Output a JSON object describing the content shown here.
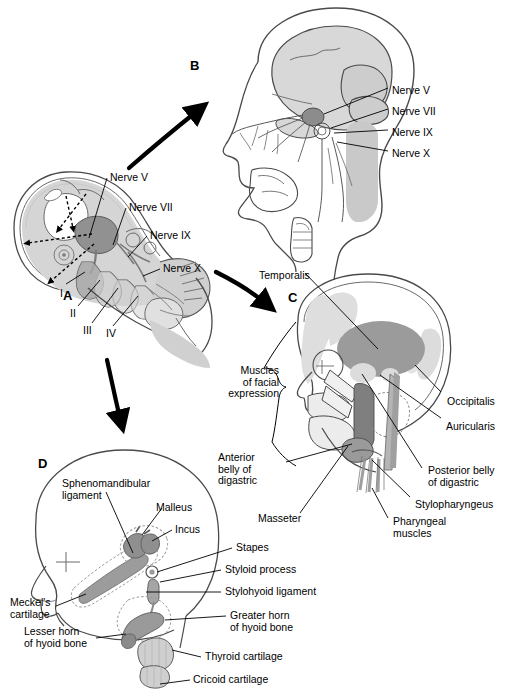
{
  "figure": {
    "panels": [
      {
        "id": "A",
        "letter": "A",
        "caption": "Embryo with pharyngeal arches and cranial nerves"
      },
      {
        "id": "B",
        "letter": "B",
        "caption": "Fetal head showing cranial nerve distribution"
      },
      {
        "id": "C",
        "letter": "C",
        "caption": "Head showing muscles derived from pharyngeal arches"
      },
      {
        "id": "D",
        "letter": "D",
        "caption": "Head showing skeletal and ligamentous derivatives"
      }
    ]
  },
  "panelA": {
    "letter": "A",
    "nerves": [
      {
        "name": "Nerve V",
        "x": 110,
        "y": 172
      },
      {
        "name": "Nerve VII",
        "x": 129,
        "y": 202
      },
      {
        "name": "Nerve IX",
        "x": 150,
        "y": 230
      },
      {
        "name": "Nerve X",
        "x": 163,
        "y": 263
      }
    ],
    "arches": [
      {
        "numeral": "I",
        "x": 60,
        "y": 288
      },
      {
        "numeral": "II",
        "x": 72,
        "y": 310
      },
      {
        "numeral": "III",
        "x": 85,
        "y": 327
      },
      {
        "numeral": "IV",
        "x": 107,
        "y": 330
      }
    ]
  },
  "panelB": {
    "letter": "B",
    "nerves": [
      {
        "name": "Nerve V",
        "x": 392,
        "y": 85
      },
      {
        "name": "Nerve VII",
        "x": 392,
        "y": 106
      },
      {
        "name": "Nerve IX",
        "x": 392,
        "y": 127
      },
      {
        "name": "Nerve X",
        "x": 392,
        "y": 148
      }
    ]
  },
  "panelC": {
    "letter": "C",
    "labels": [
      {
        "text": "Temporalis",
        "x": 259,
        "y": 270
      },
      {
        "text": "Muscles\nof facial\nexpression",
        "x": 213,
        "y": 365
      },
      {
        "text": "Anterior\nbelly of\ndigastric",
        "x": 243,
        "y": 452
      },
      {
        "text": "Masseter",
        "x": 262,
        "y": 513
      },
      {
        "text": "Occipitalis",
        "x": 447,
        "y": 396
      },
      {
        "text": "Auricularis",
        "x": 446,
        "y": 421
      },
      {
        "text": "Posterior belly\nof digastric",
        "x": 428,
        "y": 470
      },
      {
        "text": "Stylopharyngeus",
        "x": 415,
        "y": 499
      },
      {
        "text": "Pharyngeal\nmuscles",
        "x": 393,
        "y": 521
      }
    ]
  },
  "panelD": {
    "letter": "D",
    "labels": [
      {
        "text": "Sphenomandibular\nligament",
        "x": 62,
        "y": 478
      },
      {
        "text": "Malleus",
        "x": 156,
        "y": 502
      },
      {
        "text": "Incus",
        "x": 175,
        "y": 524
      },
      {
        "text": "Stapes",
        "x": 236,
        "y": 546
      },
      {
        "text": "Styloid process",
        "x": 225,
        "y": 568
      },
      {
        "text": "Stylohyoid ligament",
        "x": 225,
        "y": 590
      },
      {
        "text": "Greater horn\nof hyoid bone",
        "x": 230,
        "y": 614
      },
      {
        "text": "Thyroid cartilage",
        "x": 205,
        "y": 655
      },
      {
        "text": "Cricoid cartilage",
        "x": 193,
        "y": 678
      },
      {
        "text": "Meckel's\ncartilage",
        "x": 12,
        "y": 600
      },
      {
        "text": "Lesser horn\nof hyoid bone",
        "x": 26,
        "y": 629
      }
    ]
  },
  "arrows": [
    {
      "name": "arrow-a-to-b",
      "from": "A",
      "to": "B"
    },
    {
      "name": "arrow-a-to-c",
      "from": "A",
      "to": "C"
    },
    {
      "name": "arrow-a-to-d",
      "from": "A",
      "to": "D"
    }
  ],
  "colors": {
    "outline": "#3a3a3a",
    "line": "#000000",
    "fill_light": "#e3e3e3",
    "fill_mid": "#c9c9c9",
    "fill_dark": "#969696",
    "fill_darker": "#8a8a8a",
    "white": "#ffffff"
  }
}
